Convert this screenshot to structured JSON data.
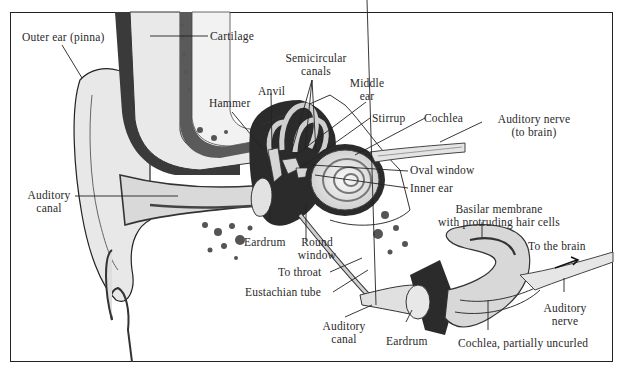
{
  "diagram": {
    "main_labels": {
      "outer_ear": "Outer ear (pinna)",
      "cartilage": "Cartilage",
      "semicircular_1": "Semicircular",
      "semicircular_2": "canals",
      "anvil": "Anvil",
      "hammer": "Hammer",
      "middle_ear_1": "Middle",
      "middle_ear_2": "ear",
      "stirrup": "Stirrup",
      "cochlea": "Cochlea",
      "auditory_nerve_1": "Auditory nerve",
      "auditory_nerve_2": "(to brain)",
      "oval_window": "Oval window",
      "inner_ear": "Inner ear",
      "auditory_canal_1": "Auditory",
      "auditory_canal_2": "canal",
      "eardrum": "Eardrum",
      "round_window_1": "Round",
      "round_window_2": "window",
      "to_throat": "To throat",
      "eustachian_tube": "Eustachian tube"
    },
    "inset_labels": {
      "basilar_1": "Basilar membrane",
      "basilar_2": "with protruding hair cells",
      "to_brain": "To the brain",
      "auditory_nerve_1": "Auditory",
      "auditory_nerve_2": "nerve",
      "auditory_canal_1": "Auditory",
      "auditory_canal_2": "canal",
      "eardrum": "Eardrum",
      "cochlea_uncurled": "Cochlea, partially uncurled"
    },
    "colors": {
      "ink": "#222222",
      "tissue": "#e6e6e6",
      "shade": "#bdbdbd",
      "dark": "#2b2b2b",
      "background": "#ffffff"
    }
  }
}
